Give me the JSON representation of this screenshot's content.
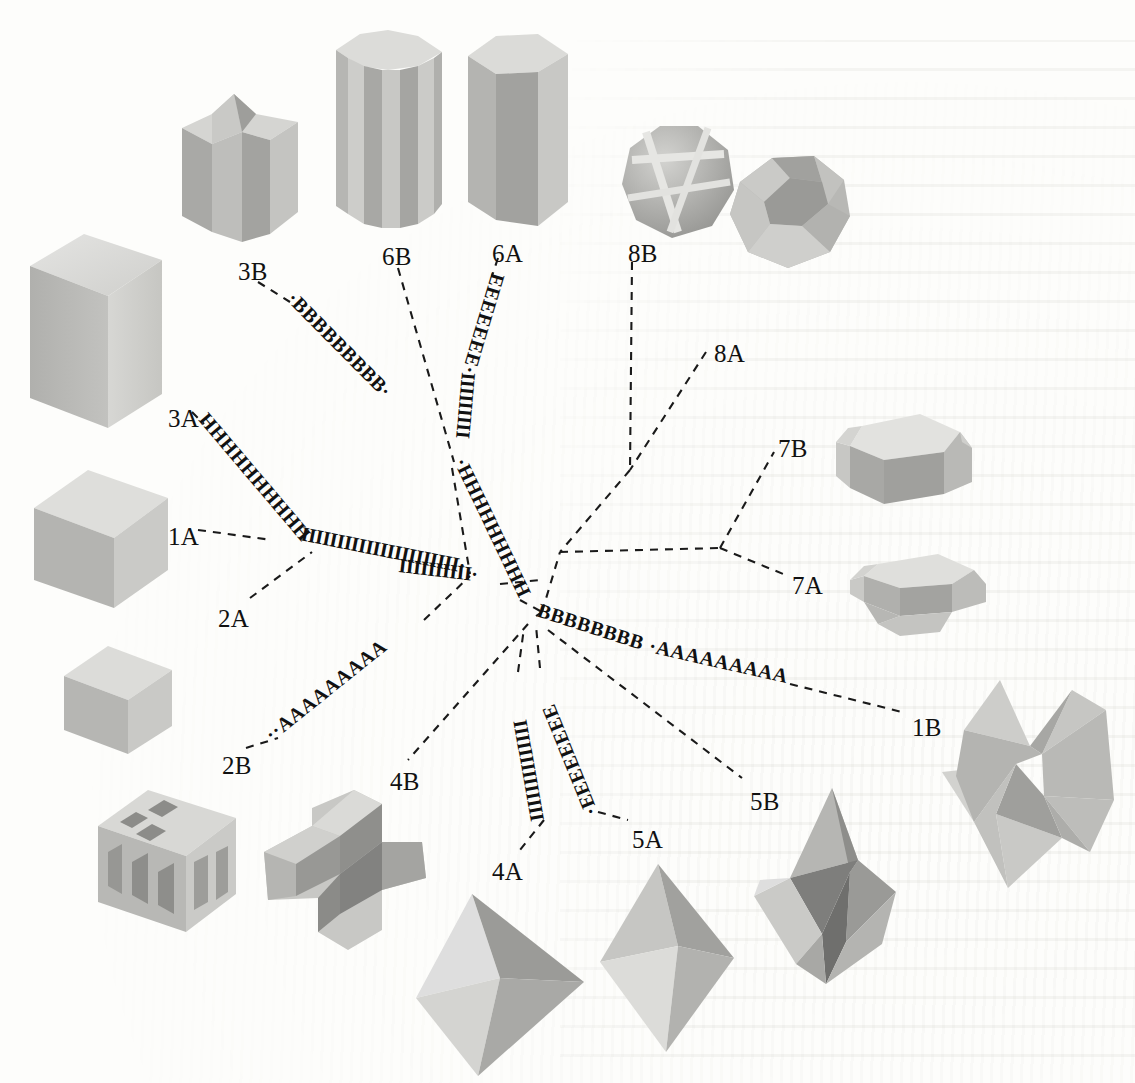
{
  "figure": {
    "type": "radial-unrooted-phylogenetic-tree",
    "background_color": "#fdfdfb",
    "line_color": "#1a1a1a",
    "label_color": "#111111"
  },
  "tip_labels": [
    {
      "id": "1A",
      "text": "1A",
      "x": 168,
      "y": 523
    },
    {
      "id": "1B",
      "text": "1B",
      "x": 912,
      "y": 714
    },
    {
      "id": "2A",
      "text": "2A",
      "x": 218,
      "y": 605
    },
    {
      "id": "2B",
      "text": "2B",
      "x": 222,
      "y": 752
    },
    {
      "id": "3A",
      "text": "3A",
      "x": 168,
      "y": 405
    },
    {
      "id": "3B",
      "text": "3B",
      "x": 238,
      "y": 258
    },
    {
      "id": "4A",
      "text": "4A",
      "x": 492,
      "y": 858
    },
    {
      "id": "4B",
      "text": "4B",
      "x": 390,
      "y": 768
    },
    {
      "id": "5A",
      "text": "5A",
      "x": 632,
      "y": 826
    },
    {
      "id": "5B",
      "text": "5B",
      "x": 750,
      "y": 788
    },
    {
      "id": "6A",
      "text": "6A",
      "x": 492,
      "y": 240
    },
    {
      "id": "6B",
      "text": "6B",
      "x": 382,
      "y": 243
    },
    {
      "id": "7A",
      "text": "7A",
      "x": 792,
      "y": 572
    },
    {
      "id": "7B",
      "text": "7B",
      "x": 778,
      "y": 435
    },
    {
      "id": "8A",
      "text": "8A",
      "x": 714,
      "y": 340
    },
    {
      "id": "8B",
      "text": "8B",
      "x": 628,
      "y": 240
    }
  ],
  "branch_sequences": [
    {
      "id": "seq-B-3B",
      "letters": "BBBBBBBBB",
      "letter": "B",
      "count": 9,
      "branch": "3B"
    },
    {
      "id": "seq-E-6A",
      "letters": "EEEEEEE",
      "letter": "E",
      "count": 7,
      "branch": "6A"
    },
    {
      "id": "seq-I-6A",
      "letters": "IIIIIIIII",
      "letter": "I",
      "count": 9,
      "branch": "6A"
    },
    {
      "id": "seq-H-core",
      "letters": "HHHHHHHHHHHHHHHHH",
      "letter": "H",
      "count": 17,
      "branch": "6-core"
    },
    {
      "id": "seq-H-3A",
      "letters": "HHHHHHHHHHHHH",
      "letter": "H",
      "count": 13,
      "branch": "3A"
    },
    {
      "id": "seq-I-long",
      "letters": "IIIIIIIIIIIIIIIIIIIIII",
      "letter": "I",
      "count": 22,
      "branch": "1A-2A-stem"
    },
    {
      "id": "seq-I-mid",
      "letters": "IIIIIIIIII",
      "letter": "I",
      "count": 10,
      "branch": "left-core"
    },
    {
      "id": "seq-A-2B",
      "letters": "AAAAAAAAA",
      "letter": "A",
      "count": 9,
      "branch": "2B"
    },
    {
      "id": "seq-B-1B",
      "letters": "BBBBBBBB",
      "letter": "B",
      "count": 8,
      "branch": "1B-stem"
    },
    {
      "id": "seq-A-1B",
      "letters": "AAAAAAAAA",
      "letter": "A",
      "count": 9,
      "branch": "1B"
    },
    {
      "id": "seq-I-4A",
      "letters": "IIIIIIIIIIIIII",
      "letter": "I",
      "count": 14,
      "branch": "4A"
    },
    {
      "id": "seq-E-5A",
      "letters": "EEEEEEEE",
      "letter": "E",
      "count": 8,
      "branch": "5A"
    }
  ],
  "crystals": [
    {
      "id": "crystal-3A-tall-prism",
      "label_for": "3A",
      "kind": "tall rectangular prism",
      "x": 22,
      "y": 228,
      "w": 145,
      "h": 215
    },
    {
      "id": "crystal-1A-cube",
      "label_for": "1A",
      "kind": "cube",
      "x": 26,
      "y": 462,
      "w": 150,
      "h": 155
    },
    {
      "id": "crystal-2A-small-cube",
      "label_for": "2A",
      "kind": "small cube",
      "x": 58,
      "y": 640,
      "w": 120,
      "h": 120
    },
    {
      "id": "crystal-2B-etched-cube",
      "label_for": "2B",
      "kind": "cube with etched cavities",
      "x": 90,
      "y": 782,
      "w": 155,
      "h": 160
    },
    {
      "id": "crystal-3B-star-prism",
      "label_for": "3B",
      "kind": "star-sectioned prism",
      "x": 172,
      "y": 92,
      "w": 140,
      "h": 160
    },
    {
      "id": "crystal-6B-fluted-prism",
      "label_for": "6B",
      "kind": "fluted hexagonal prism",
      "x": 330,
      "y": 28,
      "w": 120,
      "h": 205
    },
    {
      "id": "crystal-6A-hex-prism",
      "label_for": "6A",
      "kind": "hexagonal prism",
      "x": 462,
      "y": 30,
      "w": 112,
      "h": 200
    },
    {
      "id": "crystal-8B-grooved-sphere",
      "label_for": "8B",
      "kind": "grooved faceted sphere",
      "x": 612,
      "y": 120,
      "w": 130,
      "h": 125
    },
    {
      "id": "crystal-8A-polyhedron",
      "label_for": "8A",
      "kind": "many-faced polyhedron",
      "x": 718,
      "y": 148,
      "w": 140,
      "h": 130
    },
    {
      "id": "crystal-7B-octagonal",
      "label_for": "7B",
      "kind": "octagonal tabular crystal",
      "x": 826,
      "y": 408,
      "w": 150,
      "h": 120
    },
    {
      "id": "crystal-7A-flat-octagonal",
      "label_for": "7A",
      "kind": "flattened octagonal crystal",
      "x": 844,
      "y": 540,
      "w": 150,
      "h": 110
    },
    {
      "id": "crystal-1B-stellated",
      "label_for": "1B",
      "kind": "stellated octahedron",
      "x": 938,
      "y": 680,
      "w": 178,
      "h": 210
    },
    {
      "id": "crystal-4B-cross",
      "label_for": "4B",
      "kind": "cruciform twin crystal",
      "x": 262,
      "y": 790,
      "w": 168,
      "h": 165
    },
    {
      "id": "crystal-4A-octahedron",
      "label_for": "4A",
      "kind": "octahedron",
      "x": 412,
      "y": 890,
      "w": 176,
      "h": 188
    },
    {
      "id": "crystal-5A-dipyramid",
      "label_for": "5A",
      "kind": "elongated dipyramid",
      "x": 596,
      "y": 862,
      "w": 146,
      "h": 192
    },
    {
      "id": "crystal-5B-ridged-dipyramid",
      "label_for": "5B",
      "kind": "ridged dipyramid",
      "x": 750,
      "y": 782,
      "w": 152,
      "h": 208
    }
  ]
}
